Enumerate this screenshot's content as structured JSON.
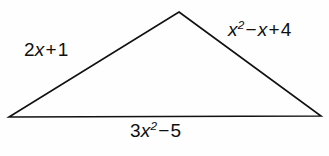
{
  "figure": {
    "type": "triangle-diagram",
    "background_color": "#fefefe",
    "stroke_color": "#111111",
    "stroke_width": 1.6,
    "vertices": {
      "apex": [
        179,
        12
      ],
      "bottom_left": [
        9,
        117
      ],
      "bottom_right": [
        321,
        116
      ]
    },
    "labels": {
      "left_side": {
        "text": "2x + 1",
        "coefficient": "2",
        "variable": "x",
        "operator": "+",
        "constant": "1"
      },
      "right_side": {
        "text": "x² − x + 4",
        "term1_variable": "x",
        "term1_exponent": "2",
        "operator1": "−",
        "term2_variable": "x",
        "operator2": "+",
        "constant": "4"
      },
      "bottom_side": {
        "text": "3x² − 5",
        "coefficient": "3",
        "variable": "x",
        "exponent": "2",
        "operator": "−",
        "constant": "5"
      }
    }
  }
}
